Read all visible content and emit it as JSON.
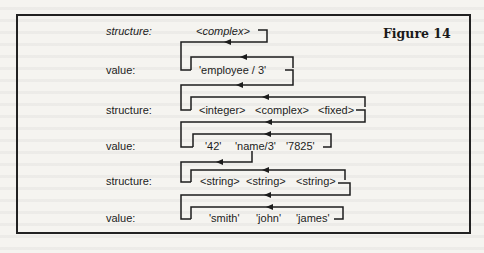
{
  "figure": {
    "title": "Figure 14"
  },
  "rows": [
    {
      "kind": "structure",
      "label": "structure:",
      "italic": true,
      "items": [
        "<complex>"
      ]
    },
    {
      "kind": "value",
      "label": "value:",
      "italic": false,
      "items": [
        "'employee / 3'"
      ]
    },
    {
      "kind": "structure",
      "label": "structure:",
      "italic": false,
      "items": [
        "<integer>",
        "<complex>",
        "<fixed>"
      ]
    },
    {
      "kind": "value",
      "label": "value:",
      "italic": false,
      "items": [
        "'42'",
        "'name/3'",
        "'7825'"
      ]
    },
    {
      "kind": "structure",
      "label": "structure:",
      "italic": false,
      "items": [
        "<string>",
        "<string>",
        "<string>"
      ]
    },
    {
      "kind": "value",
      "label": "value:",
      "italic": false,
      "items": [
        "'smith'",
        "'john'",
        "'james'"
      ]
    }
  ],
  "colors": {
    "ink": "#1c1c1c",
    "paper": "#f5f4f0",
    "frame": "#222222"
  }
}
